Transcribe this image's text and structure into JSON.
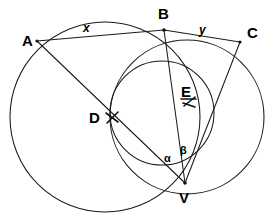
{
  "figure": {
    "type": "euclidean-geometry-diagram",
    "background_color": "#ffffff",
    "stroke_color": "#1a1a1a",
    "label_color": "#000000"
  },
  "points": [
    {
      "id": "A",
      "label": "A",
      "x": 37,
      "y": 41,
      "label_x": 22,
      "label_y": 33
    },
    {
      "id": "B",
      "label": "B",
      "x": 164,
      "y": 30,
      "label_x": 158,
      "label_y": 6
    },
    {
      "id": "C",
      "label": "C",
      "x": 240,
      "y": 42,
      "label_x": 247,
      "label_y": 25
    },
    {
      "id": "D",
      "label": "D",
      "x": 112,
      "y": 118,
      "label_x": 89,
      "label_y": 110
    },
    {
      "id": "E",
      "label": "E",
      "x": 188,
      "y": 101,
      "label_x": 181,
      "label_y": 84
    },
    {
      "id": "V",
      "label": "V",
      "x": 185,
      "y": 183,
      "label_x": 179,
      "label_y": 190
    }
  ],
  "segment_labels": [
    {
      "id": "x",
      "label": "x",
      "between": "A-B",
      "x": 83,
      "y": 22
    },
    {
      "id": "y",
      "label": "y",
      "between": "B-C",
      "x": 199,
      "y": 24
    }
  ],
  "angle_labels": [
    {
      "id": "alpha",
      "label": "α",
      "vertex": "V",
      "x": 164,
      "y": 153
    },
    {
      "id": "beta",
      "label": "β",
      "vertex": "V",
      "x": 180,
      "y": 145
    }
  ],
  "circles": [
    {
      "id": "left-circle",
      "cx": 105,
      "cy": 117,
      "r": 95,
      "passes_through": [
        "A",
        "B",
        "V"
      ]
    },
    {
      "id": "right-circle",
      "cx": 187,
      "cy": 117,
      "r": 77,
      "passes_through": [
        "B",
        "C",
        "V"
      ]
    },
    {
      "id": "middle-circle",
      "cx": 162,
      "cy": 113,
      "r": 52,
      "passes_through": [
        "B",
        "D",
        "V"
      ]
    }
  ],
  "chords": [
    {
      "id": "chord-AB",
      "from": "A",
      "to": "B",
      "label": "x"
    },
    {
      "id": "chord-BC",
      "from": "B",
      "to": "C",
      "label": "y"
    },
    {
      "id": "chord-AV",
      "from": "A",
      "to": "V",
      "through": "D"
    },
    {
      "id": "chord-BV",
      "from": "B",
      "to": "V"
    },
    {
      "id": "chord-CV",
      "from": "C",
      "to": "V",
      "through": "E"
    }
  ],
  "tick_marks": [
    {
      "id": "tick-D",
      "at": "D",
      "x": 112,
      "y": 118
    },
    {
      "id": "tick-E",
      "at": "E",
      "x": 189,
      "y": 101
    }
  ]
}
